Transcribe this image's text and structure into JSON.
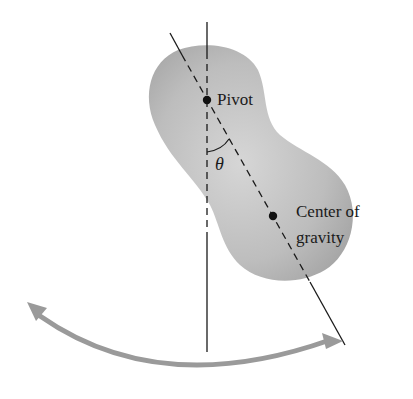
{
  "figure": {
    "labels": {
      "pivot": "Pivot",
      "angle": "θ",
      "cog_line1": "Center of",
      "cog_line2": "gravity"
    },
    "colors": {
      "body_fill": "#b3b3b3",
      "body_fill_light": "#d8d8d8",
      "arrow": "#9a9a9a",
      "line": "#1a1a1a"
    }
  }
}
